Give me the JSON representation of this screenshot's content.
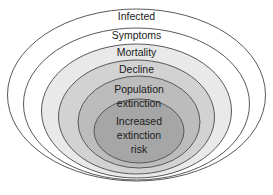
{
  "diagram": {
    "type": "nested-ellipse",
    "title": "",
    "background_color": "#ffffff",
    "stroke_color": "#595959",
    "text_color": "#1a1a1a",
    "rings": [
      {
        "id": "infected",
        "label": "Infected",
        "lines": [
          "Infected"
        ],
        "fill": "#ffffff",
        "cx": 136.5,
        "cy": 95,
        "rx": 129,
        "ry": 86,
        "label_y": 17,
        "font_size": 10.5
      },
      {
        "id": "symptoms",
        "label": "Symptoms",
        "lines": [
          "Symptoms"
        ],
        "fill": "#ffffff",
        "cx": 136.5,
        "cy": 104,
        "rx": 113,
        "ry": 76,
        "label_y": 36,
        "font_size": 10.5
      },
      {
        "id": "mortality",
        "label": "Mortality",
        "lines": [
          "Mortality"
        ],
        "fill": "#e9e9e9",
        "cx": 136.5,
        "cy": 111,
        "rx": 95,
        "ry": 67,
        "label_y": 53,
        "font_size": 10.5
      },
      {
        "id": "decline",
        "label": "Decline",
        "lines": [
          "Decline"
        ],
        "fill": "#d2d2d2",
        "cx": 136.5,
        "cy": 117,
        "rx": 78,
        "ry": 57,
        "label_y": 70,
        "font_size": 10.5
      },
      {
        "id": "population-extinction",
        "label": "Population extinction",
        "lines": [
          "Population",
          "extinction"
        ],
        "fill": "#bcbcbc",
        "cx": 139,
        "cy": 122,
        "rx": 61,
        "ry": 46,
        "label_y": 90,
        "font_size": 10.5
      },
      {
        "id": "increased-extinction-risk",
        "label": "Increased extinction risk",
        "lines": [
          "Increased",
          "extinction",
          "risk"
        ],
        "fill": "#a6a6a6",
        "cx": 139,
        "cy": 131,
        "rx": 45,
        "ry": 32,
        "label_y": 122,
        "font_size": 10.5
      }
    ]
  }
}
